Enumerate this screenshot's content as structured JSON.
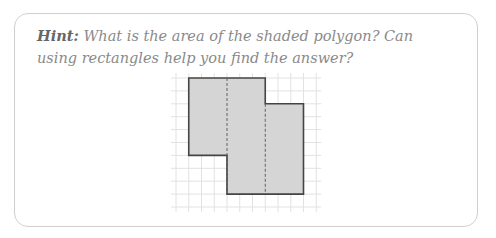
{
  "hint": {
    "label": "Hint:",
    "text": " What is the area of the shaded polygon? Can using rectangles help you find the answer?"
  },
  "figure": {
    "grid": {
      "origin_x": 176,
      "origin_y": 78,
      "cell_w": 12.75,
      "cell_h": 12.9,
      "cols": 11,
      "rows": 10,
      "overhang": 5,
      "line_color": "#e2e2e2"
    },
    "polygon": {
      "vertices_grid": [
        [
          1,
          0
        ],
        [
          7,
          0
        ],
        [
          7,
          2
        ],
        [
          10,
          2
        ],
        [
          10,
          9
        ],
        [
          4,
          9
        ],
        [
          4,
          6
        ],
        [
          1,
          6
        ]
      ],
      "fill": "#d5d5d5",
      "stroke": "#444444"
    },
    "dashed_lines_grid": [
      {
        "x": 4,
        "y1": 0,
        "y2": 9
      },
      {
        "x": 7,
        "y1": 2,
        "y2": 9
      }
    ],
    "dash_color": "#555555"
  },
  "colors": {
    "card_border": "#cfcfcf",
    "hint_label": "#666666",
    "hint_text": "#8a8a8a"
  }
}
